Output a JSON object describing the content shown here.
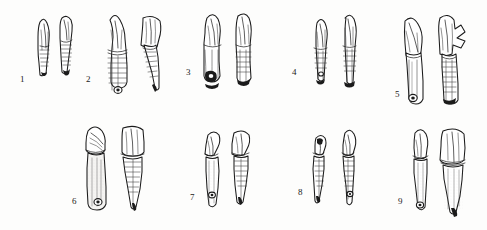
{
  "plate": {
    "title": "Plate of nine fossil tooth specimens",
    "caption_style": "numbered figure labels",
    "background_color": "#fdfdfc",
    "ink_color": "#1a1a1a",
    "shade_color": "#8d8d8d",
    "corner_mark": "",
    "width": 487,
    "height": 230,
    "rows": 2,
    "view_note": "each specimen drawn in two views"
  },
  "specimens": [
    {
      "label": "1",
      "label_x": 20,
      "label_y": 80,
      "row": 1,
      "views": 2,
      "description": "small slender incisor, pointed crown, banded root",
      "crown_type": "pointed",
      "root_type": "banded-slender",
      "foramen": false
    },
    {
      "label": "2",
      "label_x": 86,
      "label_y": 80,
      "row": 1,
      "views": 2,
      "description": "large incisor with conical crown and strongly banded root, basal foramen",
      "crown_type": "conical",
      "root_type": "banded-broad",
      "foramen": true
    },
    {
      "label": "3",
      "label_x": 186,
      "label_y": 73,
      "row": 1,
      "views": 2,
      "description": "tall narrow incisor, fractured root tip, dark basal cavity",
      "crown_type": "chisel",
      "root_type": "striated-long",
      "foramen": true
    },
    {
      "label": "4",
      "label_x": 292,
      "label_y": 73,
      "row": 1,
      "views": 2,
      "description": "slender elongate tooth, pointed apex, faint root banding",
      "crown_type": "pointed",
      "root_type": "banded-slender",
      "foramen": true
    },
    {
      "label": "5",
      "label_x": 395,
      "label_y": 95,
      "row": 1,
      "views": 2,
      "description": "large curved canine-like tooth with long root and basal foramen; second view shows broken crown",
      "crown_type": "curved-canine",
      "root_type": "long-tapering",
      "foramen": true
    },
    {
      "label": "6",
      "label_x": 72,
      "label_y": 202,
      "row": 2,
      "views": 2,
      "description": "robust tooth, broad crown with wear facets, long root with foramen",
      "crown_type": "broad-worn",
      "root_type": "long-smooth",
      "foramen": true
    },
    {
      "label": "7",
      "label_x": 190,
      "label_y": 198,
      "row": 2,
      "views": 2,
      "description": "curved slender tooth with hooked crown, root with foramen",
      "crown_type": "hooked",
      "root_type": "curved-slender",
      "foramen": true
    },
    {
      "label": "8",
      "label_x": 298,
      "label_y": 193,
      "row": 2,
      "views": 2,
      "description": "two narrow curved teeth with banded roots",
      "crown_type": "pointed",
      "root_type": "banded-curved",
      "foramen": true
    },
    {
      "label": "9",
      "label_x": 398,
      "label_y": 202,
      "row": 2,
      "views": 2,
      "description": "stout tooth with broad crown and thick root; lateral view shows wide blade-like crown",
      "crown_type": "broad-blade",
      "root_type": "thick-tapering",
      "foramen": true
    }
  ]
}
